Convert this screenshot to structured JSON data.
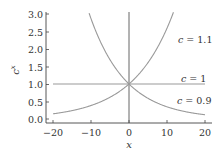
{
  "chart_data": {
    "type": "line",
    "title": "",
    "xlabel": "x",
    "ylabel": "c^x",
    "xlim": [
      -20,
      20
    ],
    "ylim": [
      0,
      3.0
    ],
    "grid": false,
    "legend": "inline labels at right",
    "x_ticks": [
      "−20",
      "−10",
      "0",
      "10",
      "20"
    ],
    "y_ticks": [
      "0.0",
      "0.5",
      "1.0",
      "1.5",
      "2.0",
      "2.5",
      "3.0"
    ],
    "series": [
      {
        "name": "c = 1.1",
        "c": 1.1,
        "label": "c = 1.1",
        "x": [
          -20,
          -10,
          0,
          5,
          10,
          11.5
        ],
        "values": [
          0.149,
          0.386,
          1.0,
          1.611,
          2.594,
          3.0
        ]
      },
      {
        "name": "c = 1",
        "c": 1.0,
        "label": "c = 1",
        "x": [
          -20,
          -10,
          0,
          10,
          20
        ],
        "values": [
          1.0,
          1.0,
          1.0,
          1.0,
          1.0
        ]
      },
      {
        "name": "c = 0.9",
        "c": 0.9,
        "label": "c = 0.9",
        "x": [
          -10.4,
          -5,
          0,
          10,
          20
        ],
        "values": [
          3.0,
          1.694,
          1.0,
          0.349,
          0.122
        ]
      }
    ],
    "annotations": [
      {
        "text": "x = 0 vertical line",
        "x": 0
      }
    ]
  },
  "labels": {
    "xlabel": "x",
    "ylabel_base": "c",
    "ylabel_sup": "x",
    "curve_11_c": "c",
    "curve_11_rest": " = 1.1",
    "curve_1_c": "c",
    "curve_1_rest": " = 1",
    "curve_09_c": "c",
    "curve_09_rest": " = 0.9"
  },
  "colors": {
    "curve": "#9a9a9a",
    "axis": "#333333",
    "text": "#333333"
  }
}
